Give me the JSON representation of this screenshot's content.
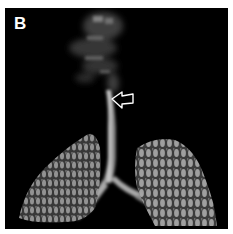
{
  "figure": {
    "panel_label": "B",
    "annotation": {
      "type": "hollow-arrow",
      "direction": "left",
      "color": "#ffffff"
    },
    "colors": {
      "background": "#000000",
      "tissue": "#bfbfbf",
      "border": "#ffffff"
    }
  }
}
